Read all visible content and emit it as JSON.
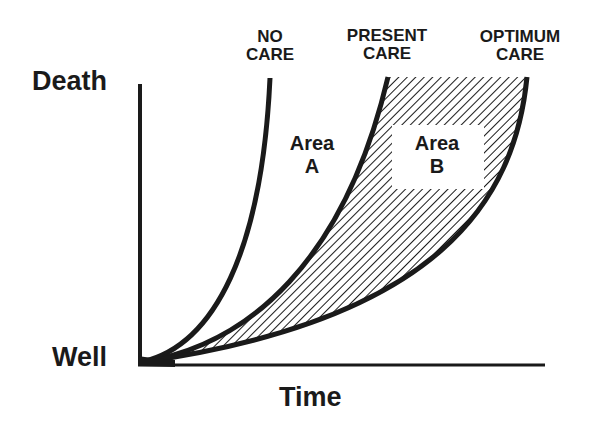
{
  "diagram": {
    "type": "conceptual-curve-diagram",
    "y_axis": {
      "top_label": "Death",
      "bottom_label": "Well"
    },
    "x_axis": {
      "label": "Time"
    },
    "curves": [
      {
        "id": "no-care",
        "label_line1": "NO",
        "label_line2": "CARE"
      },
      {
        "id": "present-care",
        "label_line1": "PRESENT",
        "label_line2": "CARE"
      },
      {
        "id": "optimum-care",
        "label_line1": "OPTIMUM",
        "label_line2": "CARE"
      }
    ],
    "areas": [
      {
        "id": "area-a",
        "line1": "Area",
        "line2": "A",
        "fill": "none"
      },
      {
        "id": "area-b",
        "line1": "Area",
        "line2": "B",
        "fill": "diagonal-hatch"
      }
    ],
    "colors": {
      "ink": "#1a1a1a",
      "background": "#ffffff"
    }
  }
}
